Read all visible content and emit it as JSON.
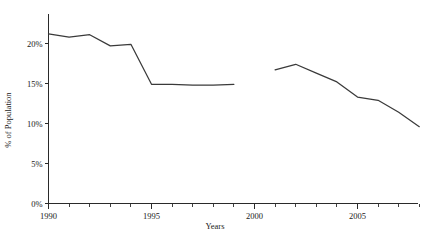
{
  "chart_data": {
    "type": "line",
    "title": "",
    "subtitle": "",
    "xlabel": "Years",
    "ylabel": "% of Population",
    "xlim": [
      1989.5,
      2008.6
    ],
    "ylim": [
      0,
      22.5
    ],
    "grid": false,
    "legend": null,
    "legend_position": "none",
    "y_ticks": [
      0,
      5,
      10,
      15,
      20
    ],
    "y_tick_labels": [
      "0%",
      "5%",
      "10%",
      "15%",
      "20%"
    ],
    "x_ticks": [
      1990,
      1991,
      1992,
      1993,
      1994,
      1995,
      1996,
      1997,
      1998,
      1999,
      2000,
      2001,
      2002,
      2003,
      2004,
      2005,
      2006,
      2007,
      2008
    ],
    "x_major_ticks": [
      1990,
      1995,
      2000,
      2005
    ],
    "x_tick_labels": [
      "1990",
      "1995",
      "2000",
      "2005"
    ],
    "line_color": "#3a3a3a",
    "axis_color": "#2a2a2a",
    "series": [
      {
        "name": "segment-1",
        "x": [
          1990,
          1991,
          1992,
          1993,
          1994,
          1995,
          1996,
          1997,
          1998,
          1999
        ],
        "values": [
          21.2,
          20.8,
          21.1,
          19.7,
          19.9,
          14.9,
          14.9,
          14.8,
          14.8,
          14.9
        ]
      },
      {
        "name": "segment-2",
        "x": [
          2001,
          2002,
          2003,
          2004,
          2005,
          2006,
          2007,
          2008
        ],
        "values": [
          16.7,
          17.4,
          16.3,
          15.2,
          13.3,
          12.9,
          11.4,
          9.6
        ]
      }
    ]
  }
}
